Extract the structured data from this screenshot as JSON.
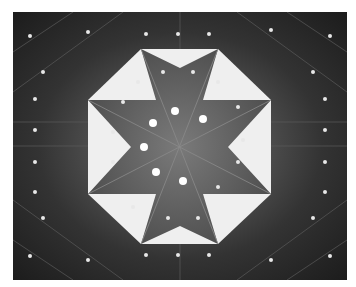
{
  "image": {
    "subject": "octagonal ceiling dome viewed from below",
    "style": "black-and-white photograph",
    "colors": {
      "border": "#ffffff",
      "dark": "#1c1c1c",
      "mid": "#6e6e6e",
      "light": "#f4f4f4"
    }
  }
}
